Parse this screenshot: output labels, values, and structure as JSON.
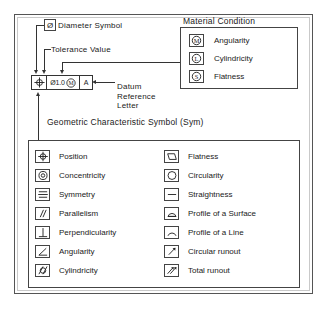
{
  "feature_control_frame": {
    "geometric_symbol": "position-symbol",
    "tolerance_value": "Ø1.0",
    "material_modifier": "circled-m-symbol",
    "datum_letter": "A"
  },
  "callouts": {
    "diameter_symbol": "Diameter Symbol",
    "diameter_chip": "Ø",
    "tolerance_value": "Tolerance Value",
    "datum_reference_letter": "Datum Reference Letter",
    "geometric_characteristic": "Geometric Characteristic Symbol (Sym)"
  },
  "material_condition": {
    "title": "Material Condition",
    "rows": [
      {
        "symbol": "circled-m-symbol",
        "glyph": "M",
        "label": "Angularity"
      },
      {
        "symbol": "circled-l-symbol",
        "glyph": "L",
        "label": "Cylindricity"
      },
      {
        "symbol": "circled-s-symbol",
        "glyph": "S",
        "label": "Flatness"
      }
    ]
  },
  "symbol_table": {
    "left_column": [
      {
        "symbol": "position-symbol",
        "label": "Position"
      },
      {
        "symbol": "concentricity-symbol",
        "label": "Concentricity"
      },
      {
        "symbol": "symmetry-symbol",
        "label": "Symmetry"
      },
      {
        "symbol": "parallelism-symbol",
        "label": "Parallelism"
      },
      {
        "symbol": "perpendicularity-symbol",
        "label": "Perpendicularity"
      },
      {
        "symbol": "angularity-symbol",
        "label": "Angularity"
      },
      {
        "symbol": "cylindricity-symbol",
        "label": "Cylindricity"
      }
    ],
    "right_column": [
      {
        "symbol": "flatness-symbol",
        "label": "Flatness"
      },
      {
        "symbol": "circularity-symbol",
        "label": "Circularity"
      },
      {
        "symbol": "straightness-symbol",
        "label": "Straightness"
      },
      {
        "symbol": "profile-of-a-surface-symbol",
        "label": "Profile of a Surface"
      },
      {
        "symbol": "profile-of-a-line-symbol",
        "label": "Profile of a Line"
      },
      {
        "symbol": "circular-runout-symbol",
        "label": "Circular runout"
      },
      {
        "symbol": "total-runout-symbol",
        "label": "Total runout"
      }
    ]
  },
  "colors": {
    "line": "#333333",
    "border": "#444444",
    "background": "#ffffff"
  }
}
